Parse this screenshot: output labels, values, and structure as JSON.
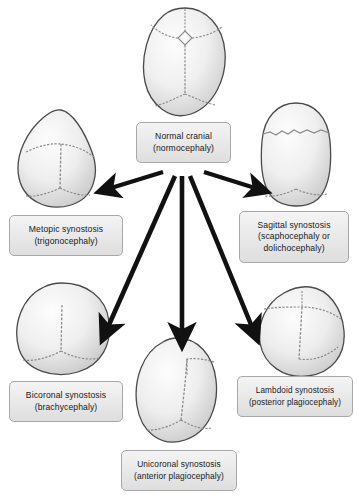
{
  "diagram": {
    "background_color": "#ffffff",
    "skull_outline_color": "#4a4a4a",
    "suture_color": "#8a8a8a",
    "arrow_color": "#1a1a1a",
    "box_border_color": "#a8a8a8",
    "box_fill_color": "#eaeaea",
    "text_color": "#1a1a1a"
  },
  "nodes": [
    {
      "id": "normal",
      "name": "normal-cranial",
      "lines": [
        "Normal cranial",
        "(normocephaly)"
      ],
      "skull_shape": "ovoid-symmetric",
      "sutures": [
        "metopic",
        "coronal",
        "sagittal",
        "lambdoid",
        "anterior-fontanelle"
      ],
      "box": {
        "x": 136,
        "y": 122,
        "w": 95,
        "h": 41
      },
      "skull": {
        "x": 140,
        "y": 6,
        "w": 90,
        "h": 112
      }
    },
    {
      "id": "metopic",
      "name": "metopic-synostosis",
      "lines": [
        "Metopic  synostosis",
        "(trigonocephaly)"
      ],
      "skull_shape": "triangular-teardrop",
      "sutures": [
        "coronal",
        "sagittal",
        "lambdoid"
      ],
      "box": {
        "x": 9,
        "y": 215,
        "w": 114,
        "h": 41
      },
      "skull": {
        "x": 14,
        "y": 108,
        "w": 93,
        "h": 101
      }
    },
    {
      "id": "sagittal",
      "name": "sagittal-synostosis",
      "lines": [
        "Sagittal synostosis",
        "(scaphocephaly or",
        "dolichocephaly)"
      ],
      "skull_shape": "narrow-elongated",
      "sutures": [
        "coronal",
        "lambdoid"
      ],
      "box": {
        "x": 239,
        "y": 211,
        "w": 110,
        "h": 52
      },
      "skull": {
        "x": 258,
        "y": 101,
        "w": 76,
        "h": 106
      }
    },
    {
      "id": "bicoronal",
      "name": "bicoronal-synostosis",
      "lines": [
        "Bicoronal  synostosis",
        "(brachycephaly)"
      ],
      "skull_shape": "wide-short",
      "sutures": [
        "sagittal",
        "lambdoid"
      ],
      "box": {
        "x": 9,
        "y": 381,
        "w": 114,
        "h": 41
      },
      "skull": {
        "x": 14,
        "y": 281,
        "w": 100,
        "h": 97
      }
    },
    {
      "id": "lambdoid",
      "name": "lambdoid-synostosis",
      "lines": [
        "Lambdoid synostosis",
        "(posterior plagiocephaly)"
      ],
      "skull_shape": "asymmetric-posterior-flattening",
      "sutures": [
        "metopic",
        "coronal",
        "sagittal"
      ],
      "box": {
        "x": 237,
        "y": 376,
        "w": 116,
        "h": 41
      },
      "skull": {
        "x": 256,
        "y": 285,
        "w": 92,
        "h": 93
      }
    },
    {
      "id": "unicoronal",
      "name": "unicoronal-synostosis",
      "lines": [
        "Unicoronal  synostosis",
        "(anterior plagiocephaly)"
      ],
      "skull_shape": "asymmetric-anterior-flattening",
      "sutures": [
        "coronal-hemi",
        "sagittal",
        "lambdoid"
      ],
      "box": {
        "x": 121,
        "y": 450,
        "w": 116,
        "h": 41
      },
      "skull": {
        "x": 133,
        "y": 336,
        "w": 88,
        "h": 108
      }
    }
  ],
  "arrows": [
    {
      "name": "arrow-to-metopic",
      "from": "normal",
      "to": "metopic",
      "direction": "down-left"
    },
    {
      "name": "arrow-to-sagittal",
      "from": "normal",
      "to": "sagittal",
      "direction": "down-right"
    },
    {
      "name": "arrow-to-bicoronal",
      "from": "normal",
      "to": "bicoronal",
      "direction": "down-left-steep"
    },
    {
      "name": "arrow-to-unicoronal",
      "from": "normal",
      "to": "unicoronal",
      "direction": "down"
    },
    {
      "name": "arrow-to-lambdoid",
      "from": "normal",
      "to": "lambdoid",
      "direction": "down-right-steep"
    }
  ]
}
